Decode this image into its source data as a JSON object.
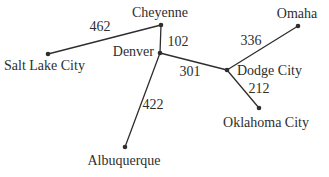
{
  "diagram": {
    "type": "weighted-graph",
    "background": "#ffffff",
    "ink": "#2e2e2e",
    "canvas": {
      "width": 329,
      "height": 177
    },
    "nodes": [
      {
        "id": "cheyenne",
        "label": "Cheyenne",
        "x": 161,
        "y": 25,
        "label_x": 160,
        "label_y": 17,
        "anchor": "middle"
      },
      {
        "id": "omaha",
        "label": "Omaha",
        "x": 298,
        "y": 26,
        "label_x": 297,
        "label_y": 18,
        "anchor": "middle"
      },
      {
        "id": "salt-lake-city",
        "label": "Salt Lake City",
        "x": 48,
        "y": 54,
        "label_x": 4,
        "label_y": 70,
        "anchor": "start"
      },
      {
        "id": "denver",
        "label": "Denver",
        "x": 160,
        "y": 53,
        "label_x": 154,
        "label_y": 56,
        "anchor": "end"
      },
      {
        "id": "dodge-city",
        "label": "Dodge City",
        "x": 227,
        "y": 70,
        "label_x": 237,
        "label_y": 75,
        "anchor": "start"
      },
      {
        "id": "oklahoma-city",
        "label": "Oklahoma City",
        "x": 259,
        "y": 108,
        "label_x": 266,
        "label_y": 127,
        "anchor": "middle"
      },
      {
        "id": "albuquerque",
        "label": "Albuquerque",
        "x": 125,
        "y": 147,
        "label_x": 124,
        "label_y": 165,
        "anchor": "middle"
      }
    ],
    "edges": [
      {
        "from": "salt-lake-city",
        "to": "cheyenne",
        "weight": "462",
        "label_x": 100,
        "label_y": 31,
        "anchor": "middle"
      },
      {
        "from": "cheyenne",
        "to": "denver",
        "weight": "102",
        "label_x": 178,
        "label_y": 46,
        "anchor": "middle"
      },
      {
        "from": "denver",
        "to": "dodge-city",
        "weight": "301",
        "label_x": 190,
        "label_y": 76,
        "anchor": "middle"
      },
      {
        "from": "dodge-city",
        "to": "omaha",
        "weight": "336",
        "label_x": 251,
        "label_y": 45,
        "anchor": "middle"
      },
      {
        "from": "dodge-city",
        "to": "oklahoma-city",
        "weight": "212",
        "label_x": 259,
        "label_y": 93,
        "anchor": "middle"
      },
      {
        "from": "denver",
        "to": "albuquerque",
        "weight": "422",
        "label_x": 153,
        "label_y": 109,
        "anchor": "middle"
      }
    ],
    "node_radius": 2.3,
    "edge_stroke_width": 1.3
  }
}
